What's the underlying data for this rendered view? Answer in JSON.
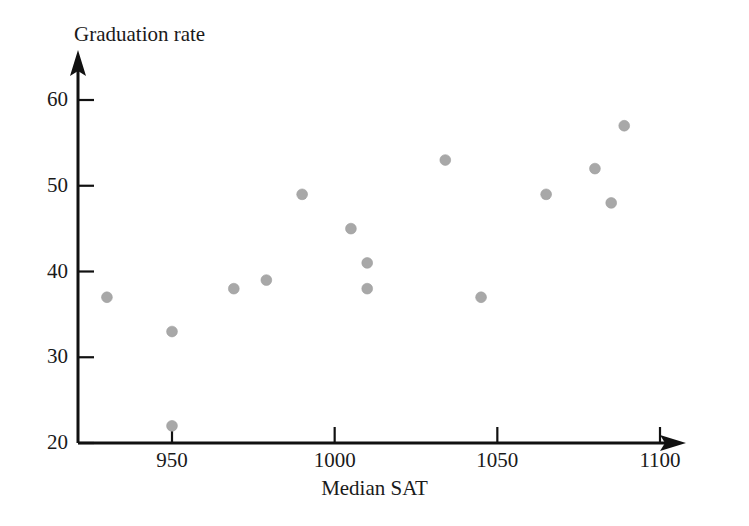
{
  "chart_data": {
    "type": "scatter",
    "title": "",
    "xlabel": "Median SAT",
    "ylabel": "Graduation rate",
    "xlim": [
      925,
      1107
    ],
    "ylim": [
      20,
      62
    ],
    "xticks": [
      950,
      1000,
      1050,
      1100
    ],
    "yticks": [
      20,
      30,
      40,
      50,
      60
    ],
    "xtick_labels": [
      "950",
      "1000",
      "1050",
      "1100"
    ],
    "ytick_labels": [
      "20",
      "30",
      "40",
      "50",
      "60"
    ],
    "grid": false,
    "legend": false,
    "marker": "circle",
    "marker_color": "#a8a8a8",
    "axis_color": "#111111",
    "background_color": "#ffffff",
    "points": [
      {
        "x": 930,
        "y": 37
      },
      {
        "x": 950,
        "y": 33
      },
      {
        "x": 950,
        "y": 22
      },
      {
        "x": 969,
        "y": 38
      },
      {
        "x": 979,
        "y": 39
      },
      {
        "x": 990,
        "y": 49
      },
      {
        "x": 1005,
        "y": 45
      },
      {
        "x": 1010,
        "y": 41
      },
      {
        "x": 1010,
        "y": 38
      },
      {
        "x": 1034,
        "y": 53
      },
      {
        "x": 1045,
        "y": 37
      },
      {
        "x": 1065,
        "y": 49
      },
      {
        "x": 1080,
        "y": 52
      },
      {
        "x": 1085,
        "y": 48
      },
      {
        "x": 1089,
        "y": 57
      }
    ]
  },
  "axes": {
    "y_title": "Graduation rate",
    "x_title": "Median SAT",
    "y_tick_labels": [
      "60",
      "50",
      "40",
      "30",
      "20"
    ],
    "x_tick_labels": [
      "950",
      "1000",
      "1050",
      "1100"
    ]
  }
}
